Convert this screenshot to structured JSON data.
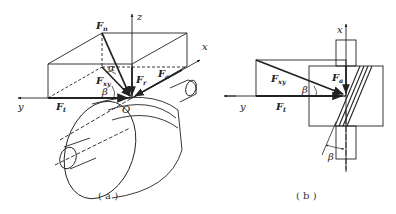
{
  "figure_a": {
    "caption": "( a )",
    "axes": {
      "x": "x",
      "y": "y",
      "z": "z"
    },
    "origin": "O",
    "forces": {
      "Fn": {
        "main": "F",
        "sub": "n"
      },
      "Fr": {
        "main": "F",
        "sub": "r"
      },
      "Fa": {
        "main": "F",
        "sub": "a"
      },
      "Ft": {
        "main": "F",
        "sub": "t"
      },
      "Fxy": {
        "main": "F",
        "sub": "xy"
      }
    },
    "angles": {
      "alpha": "α",
      "beta": "β"
    }
  },
  "figure_b": {
    "caption": "( b )",
    "axes": {
      "x": "x",
      "y": "y"
    },
    "forces": {
      "Fxy": {
        "main": "F",
        "sub": "xy"
      },
      "Fa": {
        "main": "F",
        "sub": "a"
      },
      "Ft": {
        "main": "F",
        "sub": "t"
      }
    },
    "angles": {
      "beta_top": "β",
      "beta_bottom": "β"
    }
  }
}
